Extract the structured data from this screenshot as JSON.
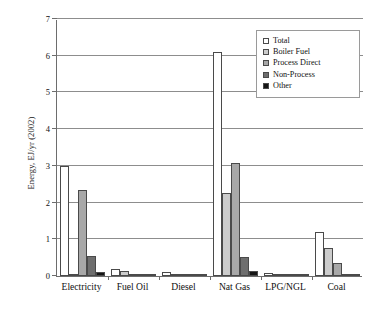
{
  "chart_data": {
    "type": "bar",
    "title": "",
    "xlabel": "",
    "ylabel": "Energy, EJ/yr (2002)",
    "ylim": [
      0,
      7
    ],
    "yticks": [
      "0",
      "1",
      "2",
      "3",
      "4",
      "5",
      "6",
      "7"
    ],
    "grid": true,
    "legend_position": "top-right",
    "categories": [
      "Electricity",
      "Fuel Oil",
      "Diesel",
      "Nat Gas",
      "LPG/NGL",
      "Coal"
    ],
    "series": [
      {
        "name": "Total",
        "color": "#ffffff",
        "values": [
          3.0,
          0.2,
          0.12,
          6.1,
          0.07,
          1.19
        ]
      },
      {
        "name": "Boiler Fuel",
        "color": "#cccccc",
        "values": [
          0.01,
          0.13,
          0.01,
          2.25,
          0.02,
          0.77
        ]
      },
      {
        "name": "Process Direct",
        "color": "#a8a8a8",
        "values": [
          2.35,
          0.05,
          0.02,
          3.09,
          0.03,
          0.35
        ]
      },
      {
        "name": "Non-Process",
        "color": "#6e6e6e",
        "values": [
          0.54,
          0.04,
          0.03,
          0.51,
          0.01,
          0.01
        ]
      },
      {
        "name": "Other",
        "color": "#151515",
        "values": [
          0.1,
          0.01,
          0.01,
          0.13,
          0.0,
          0.0
        ]
      }
    ],
    "annotations": [
      "Electricity Total bar is clipped at the 3.0 gridline (value extends above plotted range)"
    ]
  },
  "legend": {
    "items": [
      {
        "label": "Total"
      },
      {
        "label": "Boiler Fuel"
      },
      {
        "label": "Process Direct"
      },
      {
        "label": "Non-Process"
      },
      {
        "label": "Other"
      }
    ]
  }
}
